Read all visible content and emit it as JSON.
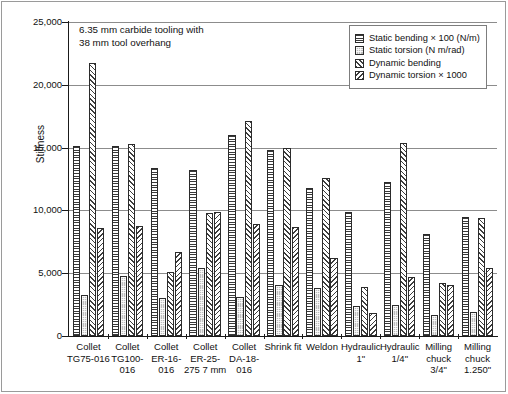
{
  "annotation": {
    "text": "6.35 mm carbide tooling with\n38 mm tool overhang"
  },
  "legend": {
    "position": "top-right",
    "items": [
      {
        "label": "Static bending × 100 (N/m)",
        "pattern": "horizontal-lines",
        "icon": "legend-swatch-horizontal-lines"
      },
      {
        "label": "Static torsion (N m/rad)",
        "pattern": "fine-dots",
        "icon": "legend-swatch-fine-dots"
      },
      {
        "label": "Dynamic bending",
        "pattern": "forward-diagonal",
        "icon": "legend-swatch-forward-diagonal"
      },
      {
        "label": "Dynamic torsion × 1000",
        "pattern": "backward-diagonal",
        "icon": "legend-swatch-backward-diagonal"
      }
    ]
  },
  "chart_data": {
    "type": "bar",
    "title": "",
    "subtitle": "",
    "xlabel": "",
    "ylabel": "Stiffness",
    "ylim": [
      0,
      25000
    ],
    "yticks": [
      0,
      5000,
      10000,
      15000,
      20000,
      25000
    ],
    "ytick_labels": [
      "0",
      "5,000",
      "10,000",
      "15,000",
      "20,000",
      "25,000"
    ],
    "grid": true,
    "legend_position": "top-right",
    "annotation": "6.35 mm carbide tooling with 38 mm tool overhang",
    "categories": [
      "Collet TG75-016",
      "Collet TG100-016",
      "Collet ER-16-016",
      "Collet ER-25-275 7 mm",
      "Collet DA-18-016",
      "Shrink fit",
      "Weldon",
      "Hydraulic 1\"",
      "Hydraulic 1/4\"",
      "Milling chuck 3/4\"",
      "Milling chuck 1.250\""
    ],
    "category_lines": [
      [
        "Collet",
        "TG75-016"
      ],
      [
        "Collet",
        "TG100-",
        "016"
      ],
      [
        "Collet",
        "ER-16-",
        "016"
      ],
      [
        "Collet",
        "ER-25-",
        "275 7 mm"
      ],
      [
        "Collet",
        "DA-18-",
        "016"
      ],
      [
        "Shrink fit"
      ],
      [
        "Weldon"
      ],
      [
        "Hydraulic",
        "1\""
      ],
      [
        "Hydraulic",
        "1/4\""
      ],
      [
        "Milling",
        "chuck",
        "3/4\""
      ],
      [
        "Milling",
        "chuck",
        "1.250\""
      ]
    ],
    "series": [
      {
        "name": "Static bending × 100 (N/m)",
        "pattern": "horizontal-lines",
        "values": [
          15100,
          15100,
          13350,
          13200,
          16000,
          14800,
          11750,
          9900,
          12300,
          8150,
          9500
        ]
      },
      {
        "name": "Static torsion (N m/rad)",
        "pattern": "fine-dots",
        "values": [
          3250,
          4750,
          3000,
          5450,
          3100,
          4050,
          3850,
          2400,
          2500,
          1700,
          1950
        ]
      },
      {
        "name": "Dynamic bending",
        "pattern": "forward-diagonal",
        "values": [
          21700,
          15250,
          5100,
          9800,
          17150,
          15000,
          12550,
          3900,
          15350,
          4200,
          9400
        ]
      },
      {
        "name": "Dynamic torsion × 1000",
        "pattern": "backward-diagonal",
        "values": [
          8600,
          8750,
          6650,
          9900,
          8950,
          8650,
          6200,
          1800,
          4700,
          4100,
          5400
        ]
      }
    ]
  }
}
